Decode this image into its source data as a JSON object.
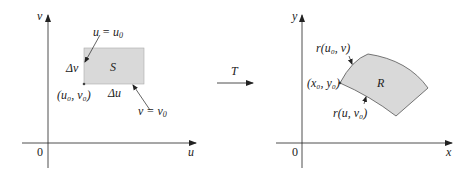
{
  "left_plot": {
    "x_axis_label": "u",
    "y_axis_label": "v",
    "origin_label": "0",
    "region_label": "S",
    "top_label_lhs": "u = u",
    "top_label_sub": "0",
    "bottom_label_lhs": "v = v",
    "bottom_label_sub": "0",
    "delta_v": "Δv",
    "delta_u": "Δu",
    "corner_label": "(u₀, v₀)",
    "region_fill": "#d9d9d9"
  },
  "transform": {
    "label": "T"
  },
  "right_plot": {
    "x_axis_label": "x",
    "y_axis_label": "y",
    "origin_label": "0",
    "region_label": "R",
    "corner_label": "(x₀, y₀)",
    "top_curve_label": "r(u₀, v)",
    "bottom_curve_label": "r(u, v₀)",
    "region_fill": "#d9d9d9"
  }
}
